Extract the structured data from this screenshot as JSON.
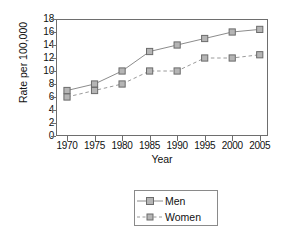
{
  "chart_data": {
    "type": "line",
    "title": "",
    "xlabel": "Year",
    "ylabel": "Rate per 100,000",
    "x": [
      1970,
      1975,
      1980,
      1985,
      1990,
      1995,
      2000,
      2005
    ],
    "xticklabels": [
      "1970",
      "1975",
      "1980",
      "1985",
      "1990",
      "1995",
      "2000",
      "2005"
    ],
    "xlim": [
      1968,
      2006.5
    ],
    "ylim": [
      0,
      18
    ],
    "yticks": [
      0,
      2,
      4,
      6,
      8,
      10,
      12,
      14,
      16,
      18
    ],
    "yticklabels": [
      "0",
      "2",
      "4",
      "6",
      "8",
      "10",
      "12",
      "14",
      "16",
      "18"
    ],
    "grid": false,
    "legend_position": "below-center",
    "series": [
      {
        "name": "Men",
        "values": [
          7,
          8,
          10,
          13,
          14,
          15,
          16,
          16.4
        ],
        "linestyle": "solid",
        "marker": "square",
        "color": "#8c8c8c",
        "marker_fill": "#b5b5b5",
        "marker_edge": "#6b6b6b"
      },
      {
        "name": "Women",
        "values": [
          6,
          7,
          8,
          10,
          10,
          12,
          12,
          12.5
        ],
        "linestyle": "dashed",
        "marker": "square",
        "color": "#9a9a9a",
        "marker_fill": "#b5b5b5",
        "marker_edge": "#6b6b6b"
      }
    ],
    "colors": {
      "axis": "#6e6e6e",
      "text": "#111111",
      "background": "#ffffff"
    }
  },
  "legend": {
    "entries": [
      {
        "label": "Men"
      },
      {
        "label": "Women"
      }
    ]
  }
}
